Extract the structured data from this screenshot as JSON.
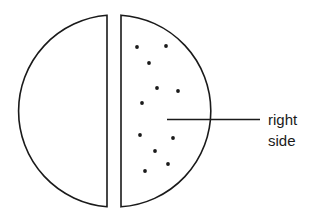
{
  "diagram": {
    "label": {
      "line1": "right",
      "line2": "side"
    },
    "halves": [
      {
        "name": "left-half",
        "dotted": false
      },
      {
        "name": "right-half",
        "dotted": true,
        "dot_count": 11
      }
    ],
    "colors": {
      "stroke": "#1a1a1a",
      "fill": "#ffffff"
    }
  }
}
